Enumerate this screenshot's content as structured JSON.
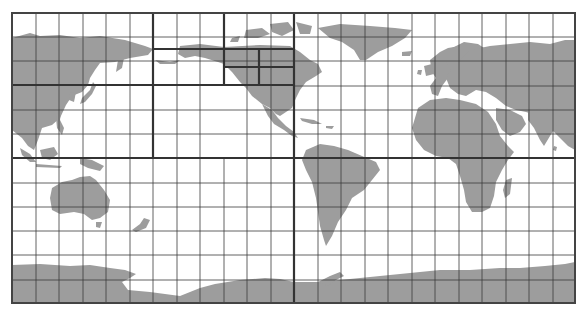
{
  "map": {
    "type": "world-map-grid",
    "projection": "pacific-centered equirectangular",
    "colors": {
      "land": "#9d9d9d",
      "ocean": "#ffffff",
      "grid": "#3a3a3a",
      "partition": "#333333"
    },
    "frame": {
      "x0": 12,
      "y0": 13,
      "x1": 575,
      "y1": 303
    },
    "grid": {
      "columns": 24,
      "rows": 12
    },
    "partitions": [
      {
        "name": "north-pacific-asia-west",
        "bounds": [
          12,
          13,
          153,
          85
        ]
      },
      {
        "name": "north-pacific-arctic-alaska",
        "bounds": [
          153,
          13,
          224,
          49
        ]
      },
      {
        "name": "arctic-canada",
        "bounds": [
          224,
          13,
          294,
          49
        ]
      },
      {
        "name": "alaska",
        "bounds": [
          153,
          49,
          224,
          85
        ]
      },
      {
        "name": "canada-west",
        "bounds": [
          224,
          49,
          259,
          67
        ]
      },
      {
        "name": "canada-east",
        "bounds": [
          259,
          49,
          294,
          67
        ]
      },
      {
        "name": "usa-west",
        "bounds": [
          224,
          67,
          259,
          85
        ]
      },
      {
        "name": "usa-east",
        "bounds": [
          259,
          67,
          294,
          85
        ]
      },
      {
        "name": "east-asia",
        "bounds": [
          12,
          85,
          153,
          158
        ]
      },
      {
        "name": "central-pacific",
        "bounds": [
          153,
          85,
          294,
          158
        ]
      },
      {
        "name": "south-pacific-oceania",
        "bounds": [
          12,
          158,
          294,
          303
        ]
      },
      {
        "name": "atlantic-europe-africa-north",
        "bounds": [
          294,
          13,
          575,
          158
        ]
      },
      {
        "name": "south-atlantic-indian",
        "bounds": [
          294,
          158,
          575,
          303
        ]
      }
    ],
    "shaded_cells": [
      "canada-west",
      "canada-east",
      "usa-east"
    ]
  }
}
